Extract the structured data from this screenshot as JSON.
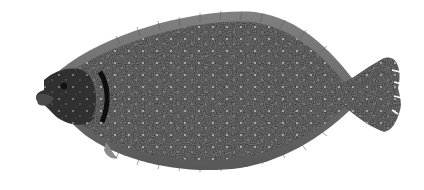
{
  "image": {
    "subject": "flounder (flatfish) illustration",
    "description": "Dark speckled flatfish with pale spots, facing left, on white background",
    "background_color": "#ffffff",
    "body_color": "#2a2a2a",
    "fin_color": "#4a4a4a",
    "spot_color": "#cfcfcf"
  }
}
